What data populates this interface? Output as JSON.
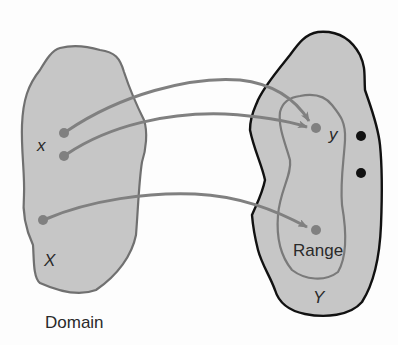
{
  "diagram": {
    "type": "function-mapping",
    "domain_set": {
      "label": "X",
      "caption": "Domain",
      "element_label": "x"
    },
    "codomain_set": {
      "label": "Y",
      "subset_label": "Range",
      "element_label": "y"
    },
    "mappings": [
      {
        "from": "x (upper point)",
        "to": "y"
      },
      {
        "from": "x (lower point)",
        "to": "y"
      },
      {
        "from": "lower point in X",
        "to": "point in Range"
      }
    ],
    "unmapped_codomain_points": 2
  },
  "colors": {
    "set_fill": "#c6c6c6",
    "domain_stroke": "#707070",
    "codomain_stroke": "#111111",
    "range_stroke": "#7a7a7a",
    "arrow": "#808080",
    "mapped_point": "#808080",
    "unmapped_point": "#111111",
    "text": "#2a2a2a"
  }
}
